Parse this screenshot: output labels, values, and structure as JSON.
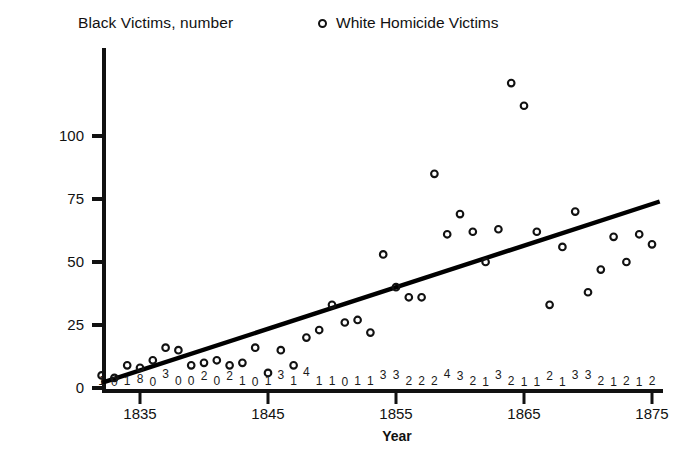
{
  "header": {
    "title": "Black Victims, number",
    "legend_marker": "open-circle",
    "legend_label": "White Homicide Victims"
  },
  "axes": {
    "x_title": "Year",
    "x_ticks": [
      "1835",
      "1845",
      "1855",
      "1865",
      "1875"
    ],
    "y_ticks": [
      "0",
      "25",
      "50",
      "75",
      "100"
    ]
  },
  "chart_data": {
    "type": "scatter",
    "title": "Black Victims, number",
    "xlabel": "Year",
    "ylabel": "",
    "xlim": [
      1832,
      1876
    ],
    "ylim": [
      0,
      128
    ],
    "grid": false,
    "legend_position": "top-center",
    "series": [
      {
        "name": "White Homicide Victims",
        "marker": "open-circle",
        "x": [
          1832,
          1833,
          1834,
          1835,
          1836,
          1837,
          1838,
          1839,
          1840,
          1841,
          1842,
          1843,
          1844,
          1845,
          1846,
          1847,
          1848,
          1849,
          1850,
          1851,
          1852,
          1853,
          1854,
          1855,
          1856,
          1857,
          1858,
          1859,
          1860,
          1861,
          1862,
          1863,
          1864,
          1865,
          1866,
          1867,
          1868,
          1869,
          1870,
          1871,
          1872,
          1873,
          1874,
          1875
        ],
        "y": [
          5,
          4,
          9,
          8,
          11,
          16,
          15,
          9,
          10,
          11,
          9,
          10,
          16,
          6,
          15,
          9,
          20,
          23,
          33,
          26,
          27,
          22,
          53,
          40,
          36,
          36,
          85,
          61,
          69,
          62,
          50,
          63,
          121,
          112,
          62,
          33,
          56,
          70,
          38,
          47,
          60,
          50,
          61,
          57
        ],
        "ylabel_units": "number"
      }
    ],
    "trend_line": {
      "name": "linear-fit",
      "x_start": 1832,
      "y_start": 2,
      "x_end": 1875.6,
      "y_end": 74
    },
    "black_victims_row": {
      "description": "Black victim counts printed as digits along the bottom of the plot",
      "years": [
        1832,
        1833,
        1834,
        1835,
        1836,
        1837,
        1838,
        1839,
        1840,
        1841,
        1842,
        1843,
        1844,
        1845,
        1846,
        1847,
        1848,
        1849,
        1850,
        1851,
        1852,
        1853,
        1854,
        1855,
        1856,
        1857,
        1858,
        1859,
        1860,
        1861,
        1862,
        1863,
        1864,
        1865,
        1866,
        1867,
        1868,
        1869,
        1870,
        1871,
        1872,
        1873,
        1874,
        1875
      ],
      "values": [
        "1",
        "0",
        "1",
        "8",
        "0",
        "3",
        "0",
        "0",
        "2",
        "0",
        "2",
        "1",
        "0",
        "1",
        "3",
        "1",
        "4",
        "1",
        "1",
        "0",
        "1",
        "1",
        "3",
        "3",
        "2",
        "2",
        "2",
        "4",
        "3",
        "2",
        "1",
        "3",
        "2",
        "1",
        "1",
        "2",
        "1",
        "3",
        "3",
        "2",
        "1",
        "2",
        "1",
        "2"
      ],
      "raised_offsets": [
        0,
        1,
        0,
        -2,
        1,
        -7,
        0,
        0,
        -5,
        0,
        -5,
        0,
        1,
        0,
        -6,
        0,
        -9,
        0,
        0,
        1,
        0,
        0,
        -6,
        -6,
        0,
        0,
        0,
        -7,
        -5,
        0,
        1,
        -6,
        0,
        1,
        1,
        -5,
        1,
        -6,
        -6,
        0,
        1,
        0,
        1,
        0
      ],
      "trailing_value": "2 2 0"
    }
  },
  "colors": {
    "ink": "#111111",
    "background": "#ffffff",
    "marker_stroke": "#111111",
    "trend_line": "#000000"
  }
}
